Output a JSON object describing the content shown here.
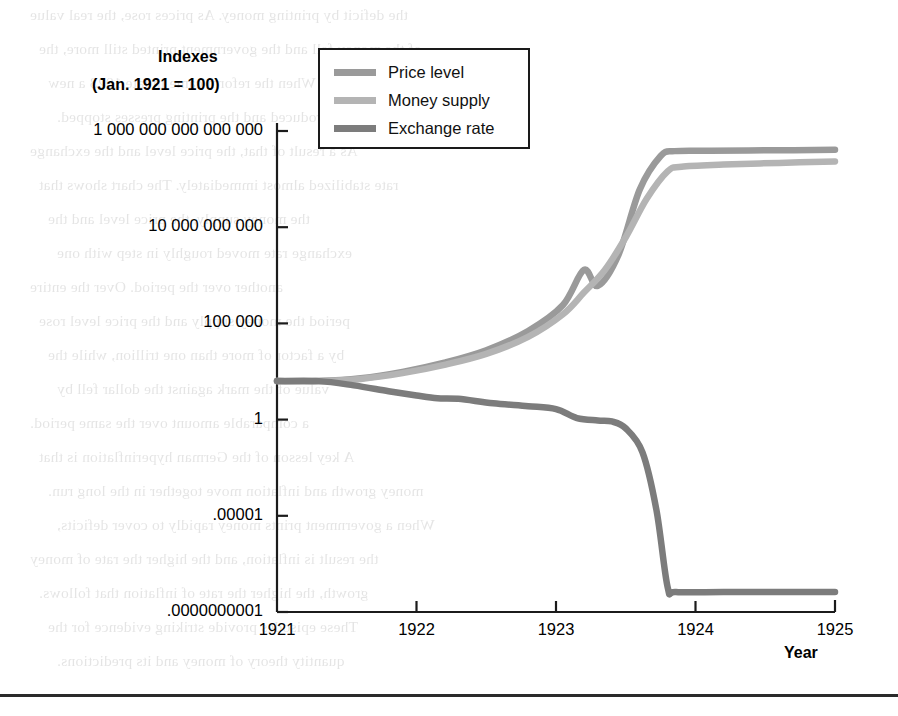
{
  "figure": {
    "y_axis_title_line1": "Indexes",
    "y_axis_title_line2": "(Jan. 1921 = 100)",
    "x_axis_title": "Year"
  },
  "legend": {
    "position": "top-left-inside",
    "items": [
      {
        "label": "Price level",
        "color": "#9a9a9a"
      },
      {
        "label": "Money supply",
        "color": "#b4b4b4"
      },
      {
        "label": "Exchange rate",
        "color": "#7c7c7c"
      }
    ]
  },
  "chart_data": {
    "type": "line",
    "title": "",
    "subtitle": "",
    "xlabel": "Year",
    "ylabel": "Indexes (Jan. 1921 = 100)",
    "yscale": "log",
    "grid": false,
    "legend_position": "top-left-inside",
    "xlim": [
      1921,
      1925
    ],
    "x_tick_labels": [
      "1921",
      "1922",
      "1923",
      "1924",
      "1925"
    ],
    "x_ticks": [
      1921,
      1922,
      1923,
      1924,
      1925
    ],
    "ylim": [
      1e-10,
      1000000000000000.0
    ],
    "y_tick_labels": [
      "1 000 000 000 000 000",
      "10 000 000 000",
      "100 000",
      "1",
      ".00001",
      ".0000000001"
    ],
    "y_ticks": [
      1000000000000000.0,
      10000000000.0,
      100000.0,
      1,
      1e-05,
      1e-10
    ],
    "series": [
      {
        "name": "Price level",
        "color": "#9a9a9a",
        "points": [
          [
            1921.0,
            100
          ],
          [
            1921.3,
            100
          ],
          [
            1921.6,
            140
          ],
          [
            1921.9,
            300
          ],
          [
            1922.2,
            900
          ],
          [
            1922.5,
            4000
          ],
          [
            1922.8,
            40000
          ],
          [
            1923.05,
            900000
          ],
          [
            1923.2,
            60000000
          ],
          [
            1923.3,
            9000000
          ],
          [
            1923.45,
            400000000
          ],
          [
            1923.6,
            900000000000
          ],
          [
            1923.75,
            50000000000000.0
          ],
          [
            1923.85,
            90000000000000.0
          ],
          [
            1924.1,
            95000000000000.0
          ],
          [
            1924.6,
            100000000000000.0
          ],
          [
            1925.0,
            105000000000000.0
          ]
        ]
      },
      {
        "name": "Money supply",
        "color": "#b4b4b4",
        "points": [
          [
            1921.0,
            100
          ],
          [
            1921.3,
            100
          ],
          [
            1921.6,
            130
          ],
          [
            1921.9,
            260
          ],
          [
            1922.2,
            700
          ],
          [
            1922.5,
            2600
          ],
          [
            1922.8,
            20000
          ],
          [
            1923.05,
            300000
          ],
          [
            1923.2,
            4000000
          ],
          [
            1923.35,
            60000000
          ],
          [
            1923.5,
            3000000000
          ],
          [
            1923.65,
            300000000000.0
          ],
          [
            1923.8,
            8000000000000.0
          ],
          [
            1923.9,
            14000000000000.0
          ],
          [
            1924.2,
            18000000000000.0
          ],
          [
            1924.6,
            22000000000000.0
          ],
          [
            1925.0,
            26000000000000.0
          ]
        ]
      },
      {
        "name": "Exchange rate",
        "color": "#7c7c7c",
        "points": [
          [
            1921.0,
            100
          ],
          [
            1921.3,
            100
          ],
          [
            1921.55,
            60
          ],
          [
            1921.8,
            30
          ],
          [
            1922.0,
            18
          ],
          [
            1922.15,
            13
          ],
          [
            1922.3,
            12
          ],
          [
            1922.55,
            7
          ],
          [
            1922.8,
            5
          ],
          [
            1923.0,
            3.5
          ],
          [
            1923.15,
            1.2
          ],
          [
            1923.3,
            0.9
          ],
          [
            1923.4,
            0.8
          ],
          [
            1923.5,
            0.35
          ],
          [
            1923.62,
            0.02
          ],
          [
            1923.72,
            2e-05
          ],
          [
            1923.8,
            2e-09
          ],
          [
            1923.86,
            1.1e-09
          ],
          [
            1924.2,
            1.1e-09
          ],
          [
            1924.6,
            1.1e-09
          ],
          [
            1925.0,
            1.1e-09
          ]
        ]
      }
    ]
  },
  "bleed_text": {
    "lines": [
      "the deficit by printing money. As prices rose, the real value",
      "of the money fell and the government printed still more, the",
      "spiral continued. When the reform came in late 1923 a new",
      "currency was introduced and the printing presses stopped.",
      "As a result of that, the price level and the exchange",
      "rate stabilized almost immediately. The chart shows that",
      "the money supply, the price level and the",
      "exchange rate moved roughly in step with one",
      "another over the period. Over the entire",
      "period the money supply and the price level rose",
      "by a factor of more than one trillion, while the",
      "value of the mark against the dollar fell by",
      "a comparable amount over the same period.",
      "A key lesson of the German hyperinflation is that",
      "money growth and inflation move together in the long run.",
      "When a government prints money rapidly to cover deficits,",
      "the result is inflation, and the higher the rate of money",
      "growth, the higher the rate of inflation that follows.",
      "These episodes provide striking evidence for the",
      "quantity theory of money and its predictions."
    ]
  }
}
